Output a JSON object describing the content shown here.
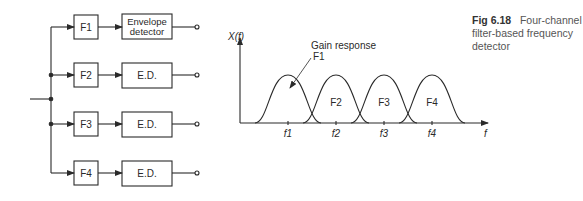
{
  "caption": {
    "figure_number": "Fig 6.18",
    "text": "Four-channel filter-based frequency detector"
  },
  "block_diagram": {
    "channels": [
      {
        "filter": "F1",
        "detector_line1": "Envelope",
        "detector_line2": "detector"
      },
      {
        "filter": "F2",
        "detector_line1": "E.D.",
        "detector_line2": ""
      },
      {
        "filter": "F3",
        "detector_line1": "E.D.",
        "detector_line2": ""
      },
      {
        "filter": "F4",
        "detector_line1": "E.D.",
        "detector_line2": ""
      }
    ]
  },
  "graph": {
    "y_label": "X(f)",
    "x_label": "f",
    "annotation_line1": "Gain response",
    "annotation_line2": "F1",
    "curve_labels": [
      "F2",
      "F3",
      "F4"
    ],
    "tick_labels": [
      "f1",
      "f2",
      "f3",
      "f4"
    ]
  },
  "colors": {
    "stroke": "#2a2a2a",
    "background": "#ffffff"
  }
}
